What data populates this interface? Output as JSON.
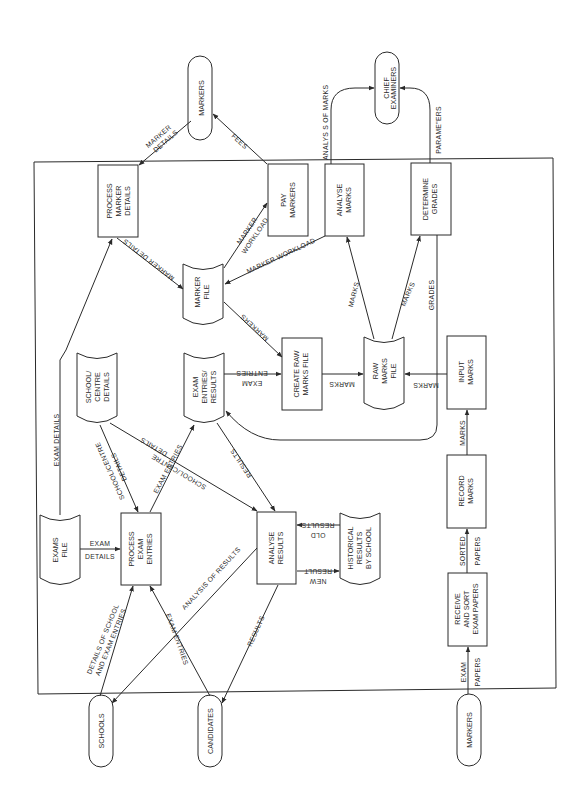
{
  "diagram": {
    "type": "data-flow-diagram",
    "orientation": "rotated-90-ccw",
    "colors": {
      "line": "#2a2a2a",
      "background": "#ffffff"
    },
    "external_entities": [
      {
        "id": "markers_top",
        "label": "MARKERS"
      },
      {
        "id": "chief",
        "line1": "CHIEF",
        "line2": "EXAMINERS"
      },
      {
        "id": "schools",
        "label": "SCHOOLS"
      },
      {
        "id": "candidates",
        "label": "CANDIDATES"
      },
      {
        "id": "markers_bottom",
        "label": "MARKERS"
      }
    ],
    "processes": [
      {
        "id": "process_marker_details",
        "lines": [
          "PROCESS",
          "MARKER",
          "DETAILS"
        ]
      },
      {
        "id": "pay_markers",
        "lines": [
          "PAY",
          "MARKERS"
        ]
      },
      {
        "id": "analyse_marks",
        "lines": [
          "ANALYSE",
          "MARKS"
        ]
      },
      {
        "id": "determine_grades",
        "lines": [
          "DETERMINE",
          "GRADES"
        ]
      },
      {
        "id": "create_raw_marks_file",
        "lines": [
          "CREATE RAW",
          "MARKS FILE"
        ]
      },
      {
        "id": "input_marks",
        "lines": [
          "INPUT",
          "MARKS"
        ]
      },
      {
        "id": "record_marks",
        "lines": [
          "RECORD",
          "MARKS"
        ]
      },
      {
        "id": "receive_sort",
        "lines": [
          "RECEIVE",
          "AND SORT",
          "EXAM PAPERS"
        ]
      },
      {
        "id": "process_exam_entries",
        "lines": [
          "PROCESS",
          "EXAM",
          "ENTRIES"
        ]
      },
      {
        "id": "analyse_results",
        "lines": [
          "ANALYSE",
          "RESULTS"
        ]
      }
    ],
    "data_stores": [
      {
        "id": "marker_file",
        "lines": [
          "MARKER",
          "FILE"
        ]
      },
      {
        "id": "raw_marks_file",
        "lines": [
          "RAW",
          "MARKS",
          "FILE"
        ]
      },
      {
        "id": "exam_entries_results",
        "lines": [
          "EXAM",
          "ENTRIES/",
          "RESULTS"
        ]
      },
      {
        "id": "school_centre_details",
        "lines": [
          "SCHOOL/",
          "CENTRE",
          "DETAILS"
        ]
      },
      {
        "id": "exams_file",
        "lines": [
          "EXAMS",
          "FILE"
        ]
      },
      {
        "id": "historical_results",
        "lines": [
          "HISTORICAL",
          "RESULTS",
          "BY SCHOOL"
        ]
      }
    ],
    "flows": {
      "marker_details_in": [
        "MARKER",
        "DETAILS"
      ],
      "fees": "FEES",
      "analysis_of_marks": "ANALYS S OF MARKS",
      "parameters": "PARAME\"ERS",
      "marker_details_store": "MARKER DETAILS",
      "marker_workload_pay": [
        "MARKER",
        "WORKLOAD"
      ],
      "marker_workload_analyse": "MARKER WORKLOAD",
      "marks_to_analyse": "MARKS",
      "marks_to_grades": "MARKS",
      "grades": "GRADES",
      "markers_to_create": "MARKERS",
      "exam_entries_to_create": [
        "EXAM",
        "ENTRIES"
      ],
      "marks_create_to_raw": "MARKS",
      "marks_input_to_raw": "MARKS",
      "exam_details": "EXAM DETAILS",
      "school_centre_details_1": [
        "SCHOOL/CENTRE",
        "DETAILS"
      ],
      "exam_entries_store": "EXAM ENTRIES",
      "school_centre_details_2": [
        "SCHOOL/CENTRE",
        "DETAILS"
      ],
      "results_store": "RESULTS",
      "marks_record_to_input": "MARKS",
      "old_results": [
        "OLD",
        "RESULTS"
      ],
      "new_result": [
        "NEW",
        "RESULT"
      ],
      "exam_details_file": [
        "EXAM",
        "DETAILS"
      ],
      "analysis_of_results": "ANALYSIS OF RESULTS",
      "details_of_school": [
        "DETAILS OF SCHOOL",
        "AND EXAM ENTRIES"
      ],
      "exam_entries_candidates": "EXAM ENTRIES",
      "results_candidates": "RESULTS",
      "sorted_papers": [
        "SORTED",
        "PAPERS"
      ],
      "exam_papers": [
        "EXAM",
        "PAPERS"
      ]
    }
  }
}
